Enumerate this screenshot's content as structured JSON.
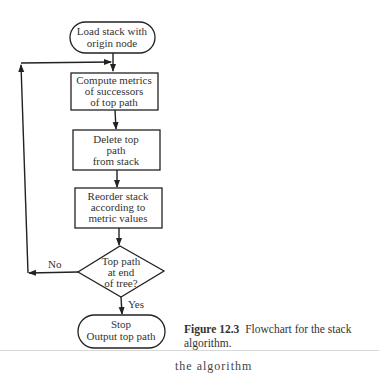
{
  "figure": {
    "nodes": {
      "start": {
        "line1": "Load stack with",
        "line2": "origin node"
      },
      "compute": {
        "line1": "Compute metrics",
        "line2": "of successors",
        "line3": "of top path"
      },
      "delete": {
        "line1": "Delete top",
        "line2": "path",
        "line3": "from stack"
      },
      "reorder": {
        "line1": "Reorder stack",
        "line2": "according to",
        "line3": "metric values"
      },
      "decision": {
        "line1": "Top path",
        "line2": "at end",
        "line3": "of tree?"
      },
      "stop": {
        "line1": "Stop",
        "line2": "Output top path"
      }
    },
    "edges": {
      "no_label": "No",
      "yes_label": "Yes"
    },
    "caption": {
      "number": "Figure 12.3",
      "text": "Flowchart for the stack algorithm."
    },
    "body_text_cutoff": "the algorithm"
  }
}
